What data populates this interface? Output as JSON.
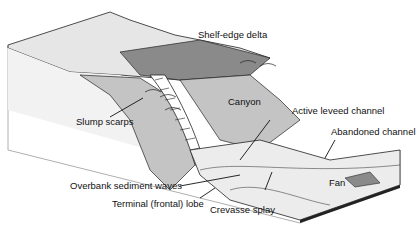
{
  "diagram": {
    "labels": {
      "shelf_edge_delta": "Shelf-edge delta",
      "canyon": "Canyon",
      "slump_scarps": "Slump scarps",
      "active_leveed_channel": "Active leveed channel",
      "abandoned_channel": "Abandoned channel",
      "overbank_sediment_waves": "Overbank sediment waves",
      "terminal_lobe": "Terminal (frontal) lobe",
      "crevasse_splay": "Crevasse splay",
      "fan": "Fan"
    },
    "colors": {
      "light": "#e6e6e6",
      "mid": "#c4c4c4",
      "dark": "#8a8a8a",
      "line": "#222222"
    }
  }
}
